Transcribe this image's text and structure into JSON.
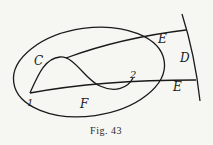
{
  "figure": {
    "caption": "Fig. 43",
    "labels": {
      "C": "C",
      "E_upper": "E",
      "D": "D",
      "point_2": "2",
      "E_lower": "E",
      "point_1": "1",
      "F": "F"
    },
    "colors": {
      "ink": "#1a1a1a",
      "paper": "#f6f6f3"
    }
  }
}
